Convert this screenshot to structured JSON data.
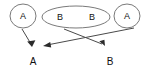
{
  "diagram": {
    "background_color": "#ffffff",
    "outline_color": "#7a7a7a",
    "line_color": "#4a4a4a",
    "arrow_color": "#2b2b2b",
    "text_color": "#111111",
    "source_nodes": [
      {
        "id": "left-circle",
        "shape": "circle",
        "label": "A",
        "cx": 23,
        "cy": 16,
        "rx": 13,
        "ry": 12
      },
      {
        "id": "middle-ellipse",
        "shape": "ellipse",
        "label_left": "B",
        "label_right": "B",
        "cx": 76,
        "cy": 17,
        "rx": 34,
        "ry": 11,
        "label_left_x": 60,
        "label_right_x": 92,
        "label_y": 17
      },
      {
        "id": "right-circle",
        "shape": "circle",
        "label": "A",
        "cx": 127,
        "cy": 16,
        "rx": 13,
        "ry": 12
      }
    ],
    "target_labels": [
      {
        "id": "target-a",
        "label": "A",
        "x": 33,
        "y": 62
      },
      {
        "id": "target-b",
        "label": "B",
        "x": 110,
        "y": 62
      }
    ],
    "arrows": [
      {
        "id": "arrow-left-a-to-a",
        "from": "left-circle",
        "to": "target-a",
        "x1": 22,
        "y1": 29,
        "x2": 32,
        "y2": 46
      },
      {
        "id": "arrow-right-a-to-a",
        "from": "right-circle",
        "to": "target-a",
        "x1": 133,
        "y1": 28,
        "x2": 44,
        "y2": 46
      },
      {
        "id": "arrow-b-to-b",
        "from": "middle-ellipse",
        "to": "target-b",
        "x1": 64,
        "y1": 29,
        "x2": 105,
        "y2": 46
      }
    ]
  }
}
